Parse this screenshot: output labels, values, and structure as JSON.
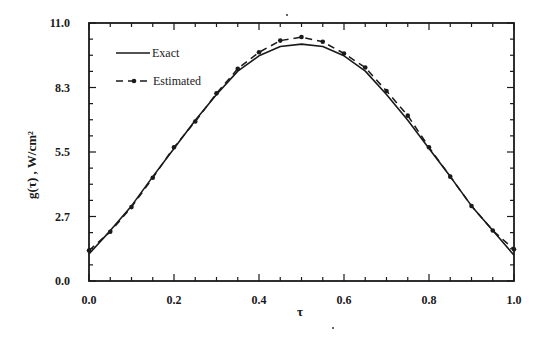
{
  "chart_data": {
    "type": "line",
    "title": "",
    "xlabel": "τ",
    "ylabel": "g(τ) , W/cm²",
    "xlim": [
      0.0,
      1.0
    ],
    "ylim": [
      0.0,
      11.0
    ],
    "x_ticks": [
      "0.0",
      "0.2",
      "0.4",
      "0.6",
      "0.8",
      "1.0"
    ],
    "y_ticks": [
      "0.0",
      "2.7",
      "5.5",
      "8.3",
      "11.0"
    ],
    "grid": false,
    "legend_position": "upper left",
    "x": [
      0.0,
      0.05,
      0.1,
      0.15,
      0.2,
      0.25,
      0.3,
      0.35,
      0.4,
      0.45,
      0.5,
      0.55,
      0.6,
      0.65,
      0.7,
      0.75,
      0.8,
      0.85,
      0.9,
      0.95,
      1.0
    ],
    "series": [
      {
        "name": "Exact",
        "style": "solid",
        "values": [
          1.15,
          2.15,
          3.2,
          4.45,
          5.65,
          6.85,
          7.95,
          8.95,
          9.6,
          10.0,
          10.1,
          10.0,
          9.6,
          8.95,
          7.95,
          6.85,
          5.65,
          4.45,
          3.2,
          2.15,
          1.1
        ]
      },
      {
        "name": "Estimated",
        "style": "dashed-with-markers",
        "values": [
          1.3,
          2.1,
          3.15,
          4.4,
          5.7,
          6.8,
          8.0,
          9.05,
          9.75,
          10.25,
          10.4,
          10.2,
          9.7,
          9.1,
          8.1,
          7.05,
          5.7,
          4.45,
          3.2,
          2.15,
          1.35
        ]
      }
    ]
  },
  "legend": {
    "items": [
      {
        "label": "Exact"
      },
      {
        "label": "Estimated"
      }
    ]
  },
  "colors": {
    "ink": "#1a1a1a",
    "background": "#ffffff"
  }
}
